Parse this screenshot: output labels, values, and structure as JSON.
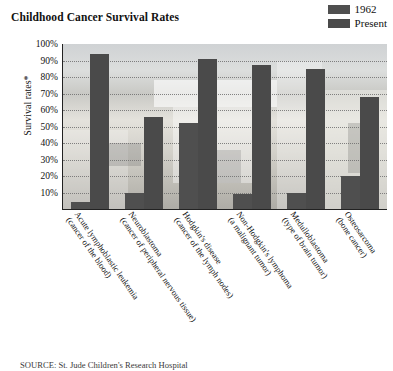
{
  "chart_data": {
    "type": "bar",
    "title": "Childhood Cancer Survival Rates",
    "xlabel": "",
    "ylabel": "Survival rates*",
    "ylim": [
      0,
      100
    ],
    "grid": true,
    "legend_position": "top-right",
    "y_ticks": [
      "100%",
      "90%",
      "80%",
      "70%",
      "60%",
      "50%",
      "40%",
      "30%",
      "20%",
      "10%"
    ],
    "y_tick_values": [
      100,
      90,
      80,
      70,
      60,
      50,
      40,
      30,
      20,
      10
    ],
    "categories": [
      "Acute lymphoblastic leukemia (cancer of the blood)",
      "Neuroblastoma (cancer of peripheral nervous tissue)",
      "Hodgkin's disease (cancer of the lymph nodes)",
      "Non-Hodgkin's lymphoma (a malignant tumor)",
      "Medulloblastoma (type of brain tumor)",
      "Osteosarcoma (bone cancer)"
    ],
    "categories_split": [
      {
        "line1": "Acute lymphoblastic leukemia",
        "line2": "(cancer of the blood)"
      },
      {
        "line1": "Neuroblastoma",
        "line2": "(cancer of peripheral nervous tissue)"
      },
      {
        "line1": "Hodgkin's disease",
        "line2": "(cancer of the lymph nodes)"
      },
      {
        "line1": "Non-Hodgkin's lymphoma",
        "line2": "(a malignant tumor)"
      },
      {
        "line1": "Medulloblastoma",
        "line2": "(type of brain tumor)"
      },
      {
        "line1": "Osteosarcoma",
        "line2": "(bone cancer)"
      }
    ],
    "series": [
      {
        "name": "1962",
        "color": "#4f4f4f",
        "values": [
          4,
          10,
          52,
          9,
          10,
          20
        ]
      },
      {
        "name": "Present",
        "color": "#4a4a4a",
        "values": [
          94,
          56,
          91,
          87,
          85,
          68
        ]
      }
    ]
  },
  "legend": {
    "items": [
      {
        "label": "1962",
        "color": "#4f4f4f"
      },
      {
        "label": "Present",
        "color": "#4a4a4a"
      }
    ]
  },
  "source": {
    "text": "SOURCE: St. Jude Children's Research Hospital"
  }
}
